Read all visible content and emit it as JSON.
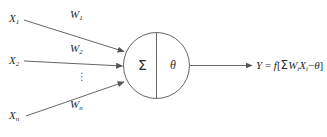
{
  "diagram": {
    "stroke_color": "#555555",
    "text_color": "#2b2b2b",
    "background": "#ffffff",
    "inputs": [
      {
        "symbol": "X",
        "subscript": "1",
        "weight_symbol": "W",
        "weight_subscript": "1"
      },
      {
        "symbol": "X",
        "subscript": "2",
        "weight_symbol": "W",
        "weight_subscript": "2"
      },
      {
        "symbol": "X",
        "subscript": "n",
        "weight_symbol": "W",
        "weight_subscript": "n"
      }
    ],
    "input_labels": {
      "x1": "X",
      "x1_sub": "1",
      "x2": "X",
      "x2_sub": "2",
      "xn": "X",
      "xn_sub": "n"
    },
    "weight_labels": {
      "w1": "W",
      "w1_sub": "1",
      "w2": "W",
      "w2_sub": "2",
      "wn": "W",
      "wn_sub": "n"
    },
    "ellipsis": "⋮",
    "body": {
      "summation_glyph": "Σ",
      "threshold_glyph": "θ"
    },
    "output": {
      "variable": "Y",
      "equals": " = ",
      "function": "f",
      "bracket_open": "[",
      "sum_glyph": "Σ",
      "weight": "W",
      "weight_sub": "i",
      "input": "X",
      "input_sub": "i",
      "minus": "−",
      "threshold": "θ",
      "bracket_close": "]",
      "full_text": "Y = f[ΣWiXi−θ]"
    }
  }
}
